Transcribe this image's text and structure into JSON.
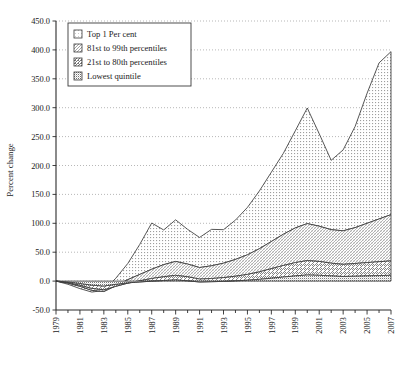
{
  "chart_data": {
    "type": "area",
    "stacked": true,
    "title": "",
    "xlabel": "",
    "ylabel": "Percent change",
    "ylim": [
      -50.0,
      450.0
    ],
    "ytick_step": 50.0,
    "ytick_labels": [
      "-50.0",
      "0.0",
      "50.0",
      "100.0",
      "150.0",
      "200.0",
      "250.0",
      "300.0",
      "350.0",
      "400.0",
      "450.0"
    ],
    "ytick_values": [
      -50,
      0,
      50,
      100,
      150,
      200,
      250,
      300,
      350,
      400,
      450
    ],
    "xlim": [
      1979,
      2007
    ],
    "x": [
      1979,
      1980,
      1981,
      1982,
      1983,
      1984,
      1985,
      1986,
      1987,
      1988,
      1989,
      1990,
      1991,
      1992,
      1993,
      1994,
      1995,
      1996,
      1997,
      1998,
      1999,
      2000,
      2001,
      2002,
      2003,
      2004,
      2005,
      2006,
      2007
    ],
    "xtick_labels": [
      "1979",
      "1981",
      "1983",
      "1985",
      "1987",
      "1989",
      "1991",
      "1993",
      "1995",
      "1997",
      "1999",
      "2001",
      "2003",
      "2005",
      "2007"
    ],
    "xtick_values": [
      1979,
      1981,
      1983,
      1985,
      1987,
      1989,
      1991,
      1993,
      1995,
      1997,
      1999,
      2001,
      2003,
      2005,
      2007
    ],
    "xtick_minor_every": 1,
    "grid": true,
    "grid_axis": "y",
    "legend_position": "top-left",
    "series": [
      {
        "name": "Lowest quintile",
        "pattern": "dense-dot-grid",
        "fill": "#d9d9d9",
        "values": [
          0.0,
          -1.5,
          -4.0,
          -7.0,
          -8.5,
          -5.5,
          -3.0,
          -1.5,
          0.0,
          1.0,
          2.0,
          0.5,
          -1.5,
          -1.0,
          -0.5,
          0.5,
          1.5,
          3.0,
          5.0,
          7.0,
          9.0,
          10.5,
          10.0,
          9.0,
          8.0,
          8.5,
          9.0,
          9.5,
          10.0
        ]
      },
      {
        "name": "21st to 80th percentiles",
        "pattern": "diagonal-hatch",
        "fill": "#e3e3e3",
        "values": [
          0.0,
          -1.0,
          -3.0,
          -5.5,
          -6.5,
          -3.5,
          -0.5,
          2.0,
          4.5,
          6.5,
          8.0,
          7.0,
          5.0,
          5.5,
          6.5,
          8.0,
          10.0,
          13.0,
          16.5,
          20.0,
          23.0,
          25.0,
          24.0,
          22.0,
          21.0,
          22.0,
          23.0,
          24.0,
          25.0
        ]
      },
      {
        "name": "81st to 99th percentiles",
        "pattern": "fine-hatch",
        "fill": "#e8e8e8",
        "values": [
          0.0,
          -1.0,
          -2.0,
          -3.5,
          -3.0,
          1.0,
          6.0,
          11.0,
          16.0,
          21.0,
          24.0,
          22.0,
          20.0,
          22.0,
          25.0,
          29.0,
          34.0,
          40.0,
          47.0,
          54.0,
          60.0,
          64.0,
          61.0,
          58.0,
          58.0,
          62.0,
          68.0,
          74.0,
          80.0
        ]
      },
      {
        "name": "Top 1 Per cent",
        "pattern": "sparse-dot",
        "fill": "#dedede",
        "values": [
          0.0,
          -2.0,
          -4.0,
          -3.0,
          2.0,
          13.0,
          28.0,
          52.0,
          80.0,
          60.0,
          72.0,
          60.0,
          52.0,
          63.0,
          58.0,
          68.0,
          82.0,
          100.0,
          120.0,
          140.0,
          168.0,
          200.0,
          160.0,
          120.0,
          140.0,
          175.0,
          225.0,
          270.0,
          282.0
        ]
      }
    ],
    "stack_top_values": [
      0.0,
      -5.5,
      -13.0,
      -19.0,
      -16.0,
      5.0,
      30.5,
      63.5,
      100.5,
      88.5,
      106.0,
      89.5,
      75.5,
      89.5,
      89.0,
      105.5,
      127.5,
      156.0,
      188.5,
      221.0,
      260.0,
      299.5,
      255.0,
      209.0,
      227.0,
      267.5,
      325.0,
      377.5,
      397.0
    ]
  },
  "legend": {
    "items": [
      {
        "label": "Top 1 Per cent"
      },
      {
        "label": "81st to 99th percentiles"
      },
      {
        "label": "21st to 80th percentiles"
      },
      {
        "label": "Lowest quintile"
      }
    ]
  }
}
